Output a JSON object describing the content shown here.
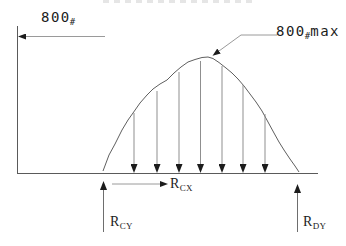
{
  "figure": {
    "load_dimension": {
      "value": "800",
      "unit": "#"
    },
    "peak_load": {
      "value": "800",
      "unit": "#",
      "suffix": "max"
    },
    "reaction_cx": {
      "base": "R",
      "sub": "CX"
    },
    "reaction_cy": {
      "base": "R",
      "sub": "CY"
    },
    "reaction_dy": {
      "base": "R",
      "sub": "DY"
    },
    "distributed_load": {
      "shape": "parabolic",
      "down_arrow_count": 7
    },
    "colors": {
      "structure_line": "#5a5a5a",
      "arrow_shaft": "#8f8f8f",
      "arrowhead": "#1c1c1c",
      "text": "#1c1c1c",
      "background": "#ffffff"
    }
  }
}
